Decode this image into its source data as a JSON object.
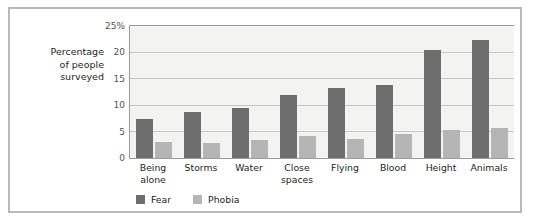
{
  "chart_data": {
    "type": "bar",
    "title": "",
    "xlabel": "",
    "ylabel": "Percentage of people surveyed",
    "ylim": [
      0,
      25
    ],
    "yticks": [
      0,
      5,
      10,
      15,
      20,
      25
    ],
    "ytick_labels": [
      "0",
      "5",
      "10",
      "15",
      "20",
      "25%"
    ],
    "grid": true,
    "legend_position": "bottom-left",
    "categories": [
      "Being alone",
      "Storms",
      "Water",
      "Close spaces",
      "Flying",
      "Blood",
      "Height",
      "Animals"
    ],
    "category_lines": [
      [
        "Being",
        "alone"
      ],
      [
        "Storms"
      ],
      [
        "Water"
      ],
      [
        "Close",
        "spaces"
      ],
      [
        "Flying"
      ],
      [
        "Blood"
      ],
      [
        "Height"
      ],
      [
        "Animals"
      ]
    ],
    "series": [
      {
        "name": "Fear",
        "color": "#6e6e6e",
        "values": [
          7.3,
          8.7,
          9.4,
          11.9,
          13.2,
          13.9,
          20.5,
          22.3
        ]
      },
      {
        "name": "Phobia",
        "color": "#b5b5b5",
        "values": [
          3.0,
          2.9,
          3.4,
          4.2,
          3.6,
          4.5,
          5.3,
          5.7
        ]
      }
    ]
  },
  "axis_title": {
    "lines": [
      "Percentage",
      "of people",
      "surveyed"
    ]
  },
  "colors": {
    "fear": "#6e6e6e",
    "phobia": "#b5b5b5",
    "plot_background": "#f3f3f1",
    "gridline": "#c6c6c4",
    "axis": "#9b9b9b",
    "frame": "#b9b9b9",
    "text": "#231f20"
  }
}
